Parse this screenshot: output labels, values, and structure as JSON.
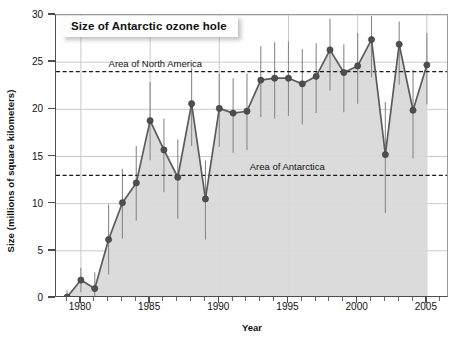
{
  "chart_data": {
    "type": "line",
    "title": "Size of Antarctic ozone hole",
    "xlabel": "Year",
    "ylabel": "Size (millions of square kilometers)",
    "xlim": [
      1978.2,
      1906.6
    ],
    "x_range": [
      1978.2,
      2006.6
    ],
    "ylim": [
      0,
      30
    ],
    "yticks": [
      0,
      5,
      10,
      15,
      20,
      25,
      30
    ],
    "xticks": [
      1980,
      1985,
      1990,
      1995,
      2000,
      2005
    ],
    "x_minor_tick_step": 1,
    "grid": true,
    "legend": "none",
    "series": [
      {
        "name": "Size of Antarctic ozone hole",
        "x": [
          1979,
          1980,
          1981,
          1982,
          1983,
          1984,
          1985,
          1986,
          1987,
          1988,
          1989,
          1990,
          1991,
          1992,
          1993,
          1994,
          1995,
          1996,
          1997,
          1998,
          1999,
          2000,
          2001,
          2002,
          2003,
          2004,
          2005
        ],
        "values": [
          0.1,
          1.9,
          1.0,
          6.2,
          10.1,
          12.2,
          18.8,
          15.7,
          12.8,
          20.6,
          10.5,
          20.1,
          19.6,
          19.8,
          23.1,
          23.3,
          23.3,
          22.7,
          23.5,
          26.3,
          23.9,
          24.6,
          27.4,
          15.2,
          26.9,
          19.9,
          24.7
        ],
        "error_low": [
          0.0,
          0.6,
          0.2,
          2.5,
          6.3,
          8.2,
          14.6,
          11.2,
          8.4,
          16.1,
          6.2,
          16.0,
          15.4,
          15.7,
          19.2,
          19.0,
          19.3,
          18.4,
          19.6,
          22.0,
          19.7,
          20.6,
          23.4,
          9.0,
          22.6,
          14.8,
          20.5
        ],
        "error_high": [
          0.8,
          3.2,
          2.7,
          9.9,
          13.7,
          16.1,
          22.9,
          19.0,
          16.8,
          24.4,
          14.6,
          23.8,
          23.3,
          23.8,
          26.7,
          27.1,
          27.2,
          26.4,
          27.0,
          29.6,
          26.9,
          28.1,
          29.9,
          20.8,
          29.3,
          24.2,
          28.1
        ]
      }
    ],
    "reference_lines": [
      {
        "label": "Area of North America",
        "value": 24,
        "label_x": 1982.0,
        "style": "dashed"
      },
      {
        "label": "Area of Antarctica",
        "value": 13,
        "label_x": 1992.2,
        "style": "dashed"
      }
    ],
    "colors": {
      "marker": "#4f4f4f",
      "line": "#5c5c5c",
      "area_fill": "#d9d9d9",
      "error_bar": "#8a8a8a",
      "grid": "#c9c9c9",
      "axis": "#4d4d4d",
      "text": "#111111",
      "title_box_bg": "#fdfdfd"
    }
  }
}
